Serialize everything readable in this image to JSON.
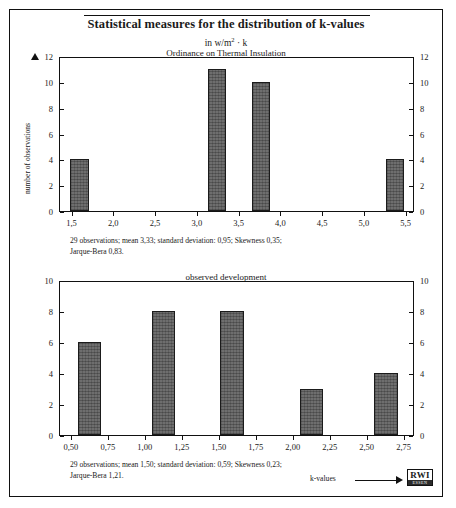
{
  "figure": {
    "title": "Statistical measures for the distribution of k-values",
    "subtitle_prefix": "in w/m",
    "subtitle_sup": "2",
    "subtitle_suffix": " · k",
    "axis_arrow_label": "k-values",
    "logo": {
      "name": "RWI",
      "city": "ESSEN"
    }
  },
  "chart_data": [
    {
      "type": "bar",
      "title": "Ordinance on Thermal Insulation",
      "xlabel": "",
      "ylabel": "number of observations",
      "xlim": [
        1.35,
        5.6
      ],
      "ylim": [
        0,
        12
      ],
      "grid": false,
      "legend": "none",
      "xticks": [
        1.5,
        2.0,
        2.5,
        3.0,
        3.5,
        4.0,
        4.5,
        5.0,
        5.5
      ],
      "xtick_labels": [
        "1,5",
        "2,0",
        "2,5",
        "3,0",
        "3,5",
        "4,0",
        "4,5",
        "5,0",
        "5,5"
      ],
      "yticks": [
        0,
        2,
        4,
        6,
        8,
        10,
        12
      ],
      "ytick_labels": [
        "0",
        "2",
        "4",
        "6",
        "8",
        "10",
        "12"
      ],
      "ytick_labels_right": [
        "0",
        "2",
        "4",
        "6",
        "8",
        "10",
        "12"
      ],
      "bars": [
        {
          "x_start": 1.47,
          "x_end": 1.7,
          "value": 4
        },
        {
          "x_start": 3.12,
          "x_end": 3.34,
          "value": 11
        },
        {
          "x_start": 3.65,
          "x_end": 3.87,
          "value": 10
        },
        {
          "x_start": 5.25,
          "x_end": 5.47,
          "value": 4
        }
      ],
      "categories": [
        "1,47–1,70",
        "3,12–3,34",
        "3,65–3,87",
        "5,25–5,47"
      ],
      "values": [
        4,
        11,
        10,
        4
      ],
      "caption": "29 observations; mean 3,33; standard deviation: 0,95; Skewness 0,35;\nJarque-Bera 0,83.",
      "stats": {
        "observations": 29,
        "mean": "3,33",
        "standard_deviation": "0,95",
        "skewness": "0,35",
        "jarque_bera": "0,83"
      }
    },
    {
      "type": "bar",
      "title": "observed development",
      "xlabel": "k-values",
      "ylabel": "",
      "xlim": [
        0.42,
        2.82
      ],
      "ylim": [
        0,
        10
      ],
      "grid": false,
      "legend": "none",
      "xticks": [
        0.5,
        0.75,
        1.0,
        1.25,
        1.5,
        1.75,
        2.0,
        2.25,
        2.5,
        2.75
      ],
      "xtick_labels": [
        "0,50",
        "0,75",
        "1,00",
        "1,25",
        "1,50",
        "1,75",
        "2,00",
        "2,25",
        "2,50",
        "2,75"
      ],
      "yticks": [
        0,
        2,
        4,
        6,
        8,
        10
      ],
      "ytick_labels": [
        "0",
        "2",
        "4",
        "6",
        "8",
        "10"
      ],
      "ytick_labels_right": [
        "0",
        "2",
        "4",
        "6",
        "8",
        "10"
      ],
      "bars": [
        {
          "x_start": 0.545,
          "x_end": 0.7,
          "value": 6
        },
        {
          "x_start": 1.04,
          "x_end": 1.2,
          "value": 8
        },
        {
          "x_start": 1.5,
          "x_end": 1.665,
          "value": 8
        },
        {
          "x_start": 2.04,
          "x_end": 2.2,
          "value": 3
        },
        {
          "x_start": 2.545,
          "x_end": 2.705,
          "value": 4
        }
      ],
      "categories": [
        "0,50–0,70",
        "1,04–1,20",
        "1,50–1,67",
        "2,04–2,20",
        "2,55–2,71"
      ],
      "values": [
        6,
        8,
        8,
        3,
        4
      ],
      "caption": "29 observations; mean 1,50; standard deviation: 0,59; Skewness 0,23;\nJarque-Bera 1,21.",
      "stats": {
        "observations": 29,
        "mean": "1,50",
        "standard_deviation": "0,59",
        "skewness": "0,23",
        "jarque_bera": "1,21"
      }
    }
  ]
}
